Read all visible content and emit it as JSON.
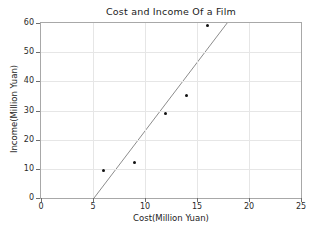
{
  "chart_data": {
    "type": "scatter",
    "title": "Cost and Income Of a Film",
    "xlabel": "Cost(Million Yuan)",
    "ylabel": "Income(Million Yuan)",
    "xlim": [
      0,
      25
    ],
    "ylim": [
      0,
      60
    ],
    "xticks": [
      0,
      5,
      10,
      15,
      20,
      25
    ],
    "yticks": [
      0,
      10,
      20,
      30,
      40,
      50,
      60
    ],
    "xtick_labels": [
      "0",
      "5",
      "10",
      "15",
      "20",
      "25"
    ],
    "ytick_labels": [
      "0",
      "10",
      "20",
      "30",
      "40",
      "50",
      "60"
    ],
    "grid": true,
    "legend": null,
    "series": [
      {
        "name": "Film data points",
        "marker": "dot",
        "color": "#111111",
        "points": [
          {
            "x": 6,
            "y": 9.3
          },
          {
            "x": 9,
            "y": 12.2
          },
          {
            "x": 12,
            "y": 29
          },
          {
            "x": 14,
            "y": 35
          },
          {
            "x": 16,
            "y": 59
          }
        ]
      },
      {
        "name": "Trend line",
        "type": "line",
        "color": "#8c8c8c",
        "x_start": 5.1,
        "y_start": 0,
        "x_end": 17.9,
        "y_end": 60,
        "slope": 4.69,
        "intercept": -23.9
      }
    ]
  },
  "colors": {
    "axis": "#a8a8a8",
    "grid": "#e6e6e6",
    "marker": "#111111",
    "trend": "#8c8c8c",
    "text": "#1b1b1b",
    "background": "#ffffff"
  }
}
